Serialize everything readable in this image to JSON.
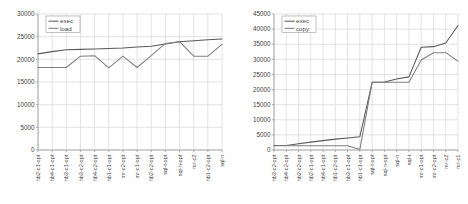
{
  "chart_data": [
    {
      "id": "left",
      "type": "line",
      "title": "",
      "xlabel": "",
      "ylabel": "",
      "ylim": [
        0,
        30000
      ],
      "ytick_values": [
        0,
        5000,
        10000,
        15000,
        20000,
        25000,
        30000
      ],
      "ytick_labels": [
        "0",
        "5000",
        "10000",
        "15000",
        "20000",
        "25000",
        "30000"
      ],
      "grid": true,
      "legend_position": "top-left",
      "categories": [
        "hb2-c1-opt",
        "hb4-c1-opt",
        "hb3-c1-opt",
        "hb3-c2-opt",
        "hb4-c2-opt",
        "hb1-c1-opt",
        "mr-c2-opt",
        "mr-c1-opt",
        "hb2-c2-opt",
        "sql-t-opt",
        "sql-n-opt",
        "mr-c2",
        "hb1-c2-opt",
        "sql-n"
      ],
      "series": [
        {
          "name": "exec",
          "color": "#595959",
          "values": [
            21200,
            21700,
            22100,
            22200,
            22300,
            22400,
            22500,
            22700,
            22900,
            23400,
            23900,
            24100,
            24300,
            24500
          ]
        },
        {
          "name": "load",
          "color": "#7f7f7f",
          "values": [
            18200,
            18200,
            18200,
            20700,
            20800,
            18100,
            20700,
            18200,
            20800,
            23500,
            23900,
            20700,
            20700,
            23300
          ]
        }
      ]
    },
    {
      "id": "right",
      "type": "line",
      "title": "",
      "xlabel": "",
      "ylabel": "",
      "ylim": [
        0,
        45000
      ],
      "ytick_values": [
        0,
        5000,
        10000,
        15000,
        20000,
        25000,
        30000,
        35000,
        40000,
        45000
      ],
      "ytick_labels": [
        "0",
        "5000",
        "10000",
        "15000",
        "20000",
        "25000",
        "30000",
        "35000",
        "40000",
        "45000"
      ],
      "grid": true,
      "legend_position": "top-left",
      "categories": [
        "hb3-c2-opt",
        "hb4-c2-opt",
        "hb2-c2-opt",
        "hb2-c1-opt",
        "hb4-c1-opt",
        "hb1-c2-opt",
        "hb3-c1-opt",
        "hb1-c1-opt",
        "sql-t-opt",
        "sql-n-opt",
        "sql-n",
        "sql-t",
        "mr-c1-opt",
        "mr-c2-opt",
        "mr-c2",
        "mr-c1"
      ],
      "series": [
        {
          "name": "exec",
          "color": "#595959",
          "values": [
            1500,
            1500,
            2100,
            2600,
            3100,
            3600,
            4000,
            4400,
            22400,
            22500,
            23500,
            24200,
            34000,
            34200,
            35400,
            41200
          ]
        },
        {
          "name": "copy",
          "color": "#7f7f7f",
          "values": [
            1400,
            1400,
            1400,
            1400,
            1400,
            1400,
            1400,
            200,
            22400,
            22400,
            22400,
            22400,
            29800,
            32200,
            32200,
            29400
          ]
        }
      ]
    }
  ]
}
